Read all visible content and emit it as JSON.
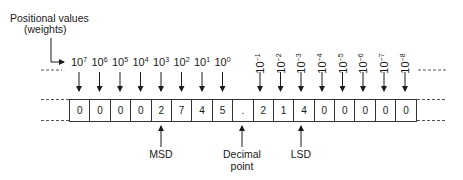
{
  "title": {
    "line1": "Positional values",
    "line2": "(weights)"
  },
  "weights": [
    {
      "base": "10",
      "exp": "7"
    },
    {
      "base": "10",
      "exp": "6"
    },
    {
      "base": "10",
      "exp": "5"
    },
    {
      "base": "10",
      "exp": "4"
    },
    {
      "base": "10",
      "exp": "3"
    },
    {
      "base": "10",
      "exp": "2"
    },
    {
      "base": "10",
      "exp": "1"
    },
    {
      "base": "10",
      "exp": "0"
    },
    {
      "base": "10",
      "exp": "−1"
    },
    {
      "base": "10",
      "exp": "−2"
    },
    {
      "base": "10",
      "exp": "−3"
    },
    {
      "base": "10",
      "exp": "−4"
    },
    {
      "base": "10",
      "exp": "−5"
    },
    {
      "base": "10",
      "exp": "−6"
    },
    {
      "base": "10",
      "exp": "−7"
    },
    {
      "base": "10",
      "exp": "−8"
    }
  ],
  "digits": [
    "0",
    "0",
    "0",
    "0",
    "2",
    "7",
    "4",
    "5",
    ".",
    "2",
    "1",
    "4",
    "0",
    "0",
    "0",
    "0",
    "0"
  ],
  "labels": {
    "msd": "MSD",
    "decimal_line1": "Decimal",
    "decimal_line2": "point",
    "lsd": "LSD"
  }
}
